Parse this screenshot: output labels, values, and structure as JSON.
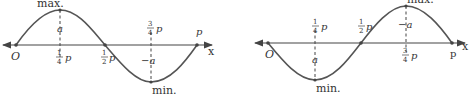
{
  "diagrams": [
    {
      "id": "left",
      "description": "sine-like wave starting at O, rising to maximum at 1/4 p, crossing at 1/2 p, minimum at 3/4 p, ending at p",
      "origin_label": "O",
      "axis_label": "x",
      "extreme_top_label": "max.",
      "extreme_bottom_label": "min.",
      "amp_top_label": "a",
      "amp_bottom_label": "−a",
      "quarter": {
        "num": "1",
        "den": "4",
        "sym": "p"
      },
      "half": {
        "num": "1",
        "den": "2",
        "sym": "p"
      },
      "three_quarter": {
        "num": "3",
        "den": "4",
        "sym": "p"
      },
      "end_label": "p"
    },
    {
      "id": "right",
      "description": "inverted wave starting at O, falling to minimum at 1/4 p, crossing at 1/2 p, maximum at 3/4 p, ending at p",
      "origin_label": "O",
      "axis_label": "x",
      "extreme_top_label": "max.",
      "extreme_bottom_label": "min.",
      "amp_top_label": "−a",
      "amp_bottom_label": "a",
      "quarter": {
        "num": "1",
        "den": "4",
        "sym": "p"
      },
      "half": {
        "num": "1",
        "den": "2",
        "sym": "p"
      },
      "three_quarter": {
        "num": "3",
        "den": "4",
        "sym": "p"
      },
      "end_label": "p"
    }
  ],
  "colors": {
    "stroke": "#555555",
    "text": "#333333"
  }
}
